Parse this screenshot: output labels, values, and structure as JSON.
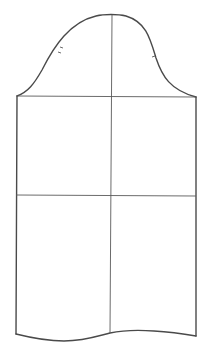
{
  "diagram": {
    "pieces": [
      {
        "name": "sleeve",
        "parts": [
          "sleeve-cap",
          "bicep-line",
          "elbow-line",
          "center-grainline",
          "hem-curve"
        ],
        "notches": {
          "back": 2,
          "front": 1
        }
      }
    ],
    "colors": {
      "outline": "#4a4a4a",
      "guide": "#5a5a5a",
      "background": "#ffffff"
    },
    "labels": {
      "cap": "Sleeve cap",
      "bicep": "Bicep line",
      "elbow": "Elbow line",
      "grain": "Center line",
      "hem": "Hem"
    }
  }
}
